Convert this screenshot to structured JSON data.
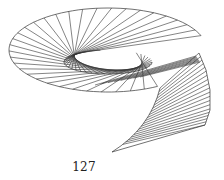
{
  "page": {
    "page_number": "127"
  },
  "figure": {
    "stroke_color": "#333333",
    "ellipse": {
      "cx": 108,
      "cy": 50,
      "rx": 99,
      "ry": 42,
      "rotate": 0
    },
    "ellipse_arc": {
      "start_deg": 70,
      "end_deg": 368,
      "chords": 34
    },
    "inner_curve": {
      "cx": 108,
      "cy": 62,
      "rx": 44,
      "ry": 12
    },
    "hook": {
      "outer": [
        [
          199,
          53
        ],
        [
          206,
          70
        ],
        [
          210,
          90
        ],
        [
          210,
          110
        ],
        [
          205,
          125
        ]
      ],
      "tip": [
        112,
        152
      ],
      "chords": 20
    }
  }
}
